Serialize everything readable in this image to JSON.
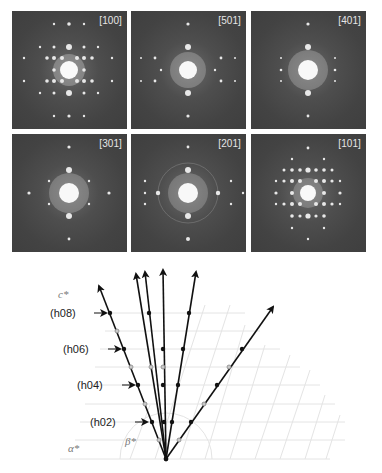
{
  "figure": {
    "panels": [
      {
        "label": "[100]",
        "pattern": "dense-grid"
      },
      {
        "label": "[501]",
        "pattern": "sparse-cross"
      },
      {
        "label": "[401]",
        "pattern": "sparse-cross"
      },
      {
        "label": "[301]",
        "pattern": "sparse-diamond"
      },
      {
        "label": "[201]",
        "pattern": "ring-cross"
      },
      {
        "label": "[101]",
        "pattern": "dense-grid"
      }
    ],
    "diagram": {
      "axis_labels": {
        "c_star": "c*",
        "alpha_star": "α*",
        "beta_star": "β*"
      },
      "row_labels": [
        "(h08)",
        "(h06)",
        "(h04)",
        "(h02)"
      ],
      "colors": {
        "line": "#111111",
        "filled_dot": "#111111",
        "open_dot": "#9a9a9a",
        "grid": "#e6e6e6",
        "panel_bg": "#454545",
        "panel_label": "#e6e6e6"
      }
    }
  }
}
